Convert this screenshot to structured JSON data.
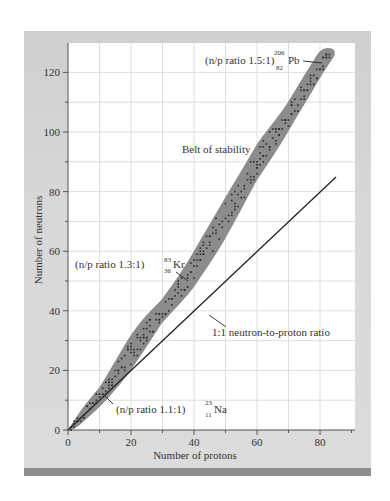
{
  "chart_data": {
    "type": "scatter",
    "title": "",
    "xlabel": "Number of protons",
    "ylabel": "Number of neutrons",
    "xlim": [
      0,
      90
    ],
    "ylim": [
      0,
      128
    ],
    "x_ticks": [
      0,
      20,
      40,
      60,
      80
    ],
    "y_ticks": [
      0,
      20,
      40,
      60,
      80,
      100,
      120
    ],
    "grid": true,
    "series": [
      {
        "name": "Belt of stability",
        "kind": "band",
        "upper_edge": [
          [
            0,
            0
          ],
          [
            10,
            14
          ],
          [
            20,
            32
          ],
          [
            30,
            44
          ],
          [
            40,
            60
          ],
          [
            50,
            78
          ],
          [
            60,
            96
          ],
          [
            70,
            110
          ],
          [
            78,
            124
          ],
          [
            82,
            127
          ]
        ],
        "lower_edge": [
          [
            0,
            0
          ],
          [
            5,
            3
          ],
          [
            20,
            20
          ],
          [
            30,
            36
          ],
          [
            40,
            48
          ],
          [
            50,
            64
          ],
          [
            60,
            84
          ],
          [
            70,
            100
          ],
          [
            80,
            118
          ],
          [
            84,
            126
          ]
        ]
      },
      {
        "name": "1:1 neutron-to-proton ratio",
        "kind": "line",
        "points": [
          [
            0,
            0
          ],
          [
            85,
            85
          ]
        ]
      }
    ],
    "annotations": [
      {
        "text": "(n/p ratio 1.5:1)",
        "nuclide": "Pb",
        "mass": "206",
        "atomic": "82",
        "point": [
          82,
          124
        ]
      },
      {
        "text": "(n/p ratio 1.3:1)",
        "nuclide": "Kr",
        "mass": "83",
        "atomic": "36",
        "point": [
          36,
          47
        ]
      },
      {
        "text": "(n/p ratio 1.1:1)",
        "nuclide": "Na",
        "mass": "23",
        "atomic": "11",
        "point": [
          11,
          12
        ]
      },
      {
        "text": "Belt of stability"
      },
      {
        "text": "1:1 neutron-to-proton ratio"
      }
    ]
  },
  "labels": {
    "x_axis": "Number of protons",
    "y_axis": "Number of neutrons",
    "belt": "Belt of stability",
    "line": "1:1 neutron-to-proton ratio",
    "pb": {
      "ratio": "(n/p ratio 1.5:1)",
      "mass": "206",
      "atomic": "82",
      "symbol": "Pb"
    },
    "kr": {
      "ratio": "(n/p ratio 1.3:1)",
      "mass": "83",
      "atomic": "36",
      "symbol": "Kr"
    },
    "na": {
      "ratio": "(n/p ratio 1.1:1)",
      "mass": "23",
      "atomic": "11",
      "symbol": "Na"
    },
    "x_ticks": [
      "0",
      "20",
      "40",
      "60",
      "80"
    ],
    "y_ticks": [
      "0",
      "20",
      "40",
      "60",
      "80",
      "100",
      "120"
    ]
  },
  "colors": {
    "frame": "#d4d4d4",
    "plot_bg": "#ffffff",
    "grid": "#dcdcdc",
    "belt": "#8a8a8a",
    "dots": "#2a2a2a",
    "line": "#222222",
    "bottom_bar": "#8e8e8e"
  }
}
